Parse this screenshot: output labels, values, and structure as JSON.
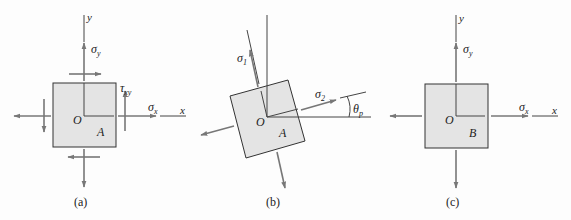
{
  "figure": {
    "colors": {
      "element_fill": "#e4e4e4",
      "element_stroke": "#333333",
      "arrow": "#777777",
      "axis": "#444444",
      "text": "#222222"
    },
    "panels": [
      {
        "id": "a",
        "caption": "(a)",
        "origin_label": "O",
        "point_label": "A",
        "axis_x_label": "x",
        "axis_y_label": "y",
        "stress_labels": {
          "sigma_x": "σ",
          "sigma_x_sub": "x",
          "sigma_y": "σ",
          "sigma_y_sub": "y",
          "tau_xy": "τ",
          "tau_xy_sub": "xy"
        },
        "description": "Plane stress element with normal stresses σx, σy and shear stress τxy"
      },
      {
        "id": "b",
        "caption": "(b)",
        "origin_label": "O",
        "point_label": "A",
        "stress_labels": {
          "sigma_1": "σ",
          "sigma_1_sub": "1",
          "sigma_2": "σ",
          "sigma_2_sub": "2",
          "theta": "θ",
          "theta_sub": "p"
        },
        "description": "Element rotated by principal angle θp showing principal stresses σ1 and σ2"
      },
      {
        "id": "c",
        "caption": "(c)",
        "origin_label": "O",
        "point_label": "B",
        "axis_x_label": "x",
        "axis_y_label": "y",
        "stress_labels": {
          "sigma_x": "σ",
          "sigma_x_sub": "x",
          "sigma_y": "σ",
          "sigma_y_sub": "y"
        },
        "description": "Element with normal stresses σx and σy only (no shear)"
      }
    ]
  }
}
